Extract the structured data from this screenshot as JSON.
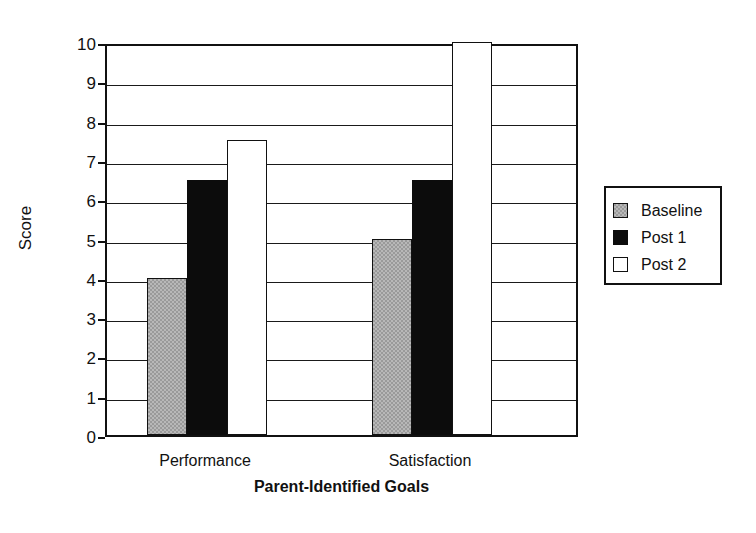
{
  "chart_data": {
    "type": "bar",
    "title": "",
    "xlabel": "Parent-Identified Goals",
    "ylabel": "Score",
    "categories": [
      "Performance",
      "Satisfaction"
    ],
    "series": [
      {
        "name": "Baseline",
        "values": [
          4,
          5
        ],
        "color": "#9a9a9a"
      },
      {
        "name": "Post 1",
        "values": [
          6.5,
          6.5
        ],
        "color": "#0c0c0c"
      },
      {
        "name": "Post 2",
        "values": [
          7.5,
          10
        ],
        "color": "#ffffff"
      }
    ],
    "ylim": [
      0,
      10
    ],
    "y_ticks": [
      0,
      1,
      2,
      3,
      4,
      5,
      6,
      7,
      8,
      9,
      10
    ],
    "y_tick_labels": [
      "0",
      "1",
      "2",
      "3",
      "4",
      "5",
      "6",
      "7",
      "8",
      "9",
      "10"
    ],
    "grid": true,
    "grid_axis": "y",
    "legend_position": "right",
    "legend_entries": [
      "Baseline",
      "Post 1",
      "Post 2"
    ]
  },
  "axis": {
    "y_title": "Score",
    "x_title": "Parent-Identified Goals"
  },
  "legend": {
    "items": [
      {
        "label": "Baseline"
      },
      {
        "label": "Post 1"
      },
      {
        "label": "Post 2"
      }
    ]
  }
}
